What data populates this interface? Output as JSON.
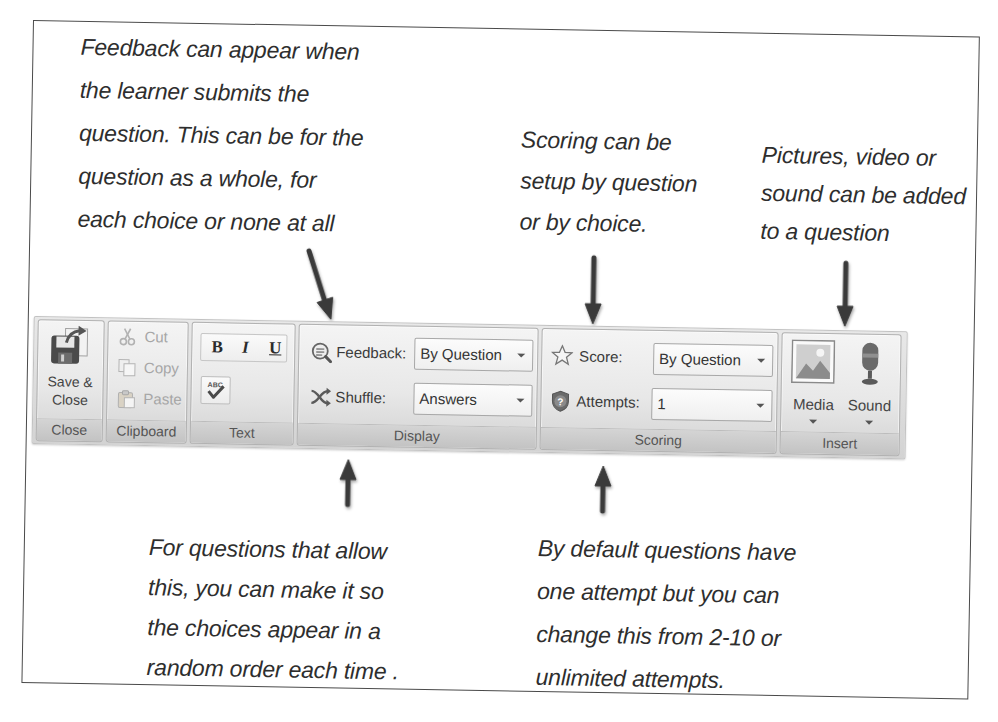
{
  "annotations": {
    "feedback": [
      "Feedback can appear when",
      "the learner submits the",
      "question. This can be for the",
      "question as a whole, for",
      "each choice or none at all"
    ],
    "scoring": [
      "Scoring can be",
      "setup by question",
      "or by choice."
    ],
    "media": [
      "Pictures, video or",
      "sound can be added",
      "to a question"
    ],
    "shuffle": [
      "For questions that allow",
      "this, you can make it so",
      "the choices appear in a",
      "random order each time ."
    ],
    "attempts": [
      "By default questions have",
      "one attempt but you can",
      "change this from 2-10 or",
      "unlimited attempts."
    ]
  },
  "ribbon": {
    "close": {
      "label": "Close",
      "button": {
        "line1": "Save &",
        "line2": "Close",
        "icon": "save-close-icon"
      }
    },
    "clipboard": {
      "label": "Clipboard",
      "items": [
        {
          "label": "Cut",
          "icon": "scissors-icon",
          "enabled": false
        },
        {
          "label": "Copy",
          "icon": "copy-icon",
          "enabled": false
        },
        {
          "label": "Paste",
          "icon": "paste-icon",
          "enabled": false
        }
      ]
    },
    "text": {
      "label": "Text",
      "bold": "B",
      "italic": "I",
      "underline": "U",
      "spelling_icon": "spell-check-icon"
    },
    "display": {
      "label": "Display",
      "feedback": {
        "label": "Feedback:",
        "value": "By Question",
        "icon": "feedback-icon"
      },
      "shuffle": {
        "label": "Shuffle:",
        "value": "Answers",
        "icon": "shuffle-icon"
      }
    },
    "scoring": {
      "label": "Scoring",
      "score": {
        "label": "Score:",
        "value": "By Question",
        "icon": "star-icon"
      },
      "attempts": {
        "label": "Attempts:",
        "value": "1",
        "icon": "attempts-icon"
      }
    },
    "insert": {
      "label": "Insert",
      "media": {
        "label": "Media",
        "icon": "picture-icon"
      },
      "sound": {
        "label": "Sound",
        "icon": "microphone-icon"
      }
    }
  },
  "colors": {
    "annotation_text": "#2e2e2e",
    "arrow": "#3a3a3a",
    "frame_border": "#4a4a4a",
    "ribbon_background": "#dcdcdc",
    "group_label_bar": "#c8c8c8",
    "disabled_text": "#a6a6a6"
  }
}
